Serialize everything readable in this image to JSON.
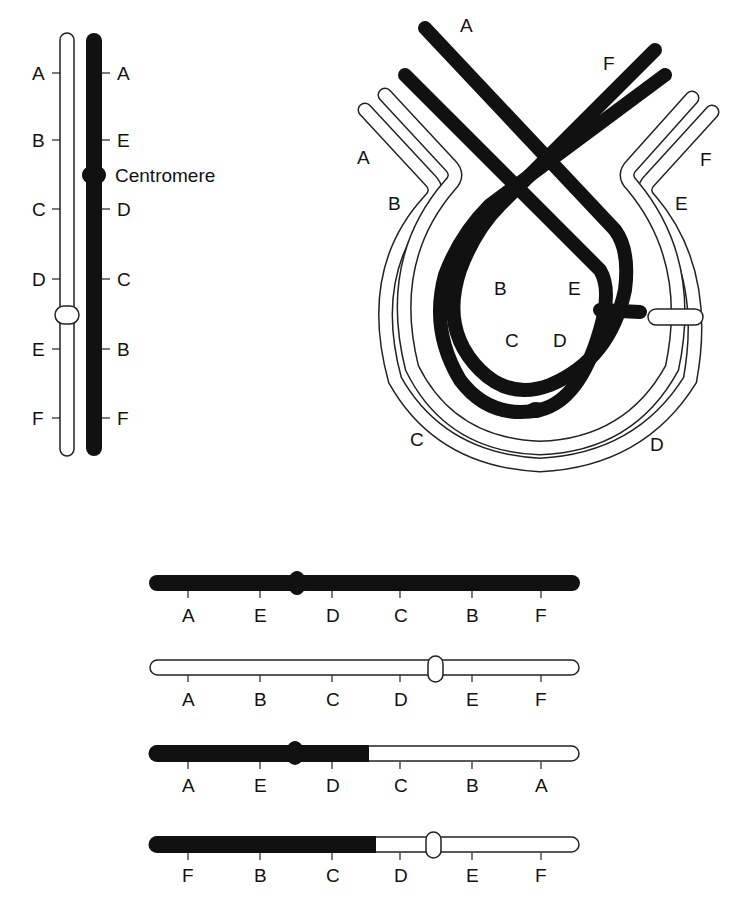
{
  "figure": {
    "type": "paracentric-inversion-diagram",
    "colors": {
      "inverted_chromosome": "#111111",
      "normal_chromosome": "#ffffff",
      "outline": "#222222"
    }
  },
  "panel_top_left": {
    "normal_chromosome": {
      "labels": [
        "A",
        "B",
        "C",
        "D",
        "E",
        "F"
      ],
      "fill": "white"
    },
    "inverted_chromosome": {
      "labels": [
        "A",
        "E",
        "D",
        "C",
        "B",
        "F"
      ],
      "fill": "black"
    },
    "centromere_label": "Centromere"
  },
  "panel_top_right": {
    "description": "Inversion loop formed during synapsis",
    "outer_labels": [
      "A",
      "B",
      "C",
      "D",
      "E",
      "F"
    ],
    "inner_labels": [
      "A",
      "B",
      "C",
      "D",
      "E",
      "F"
    ]
  },
  "panel_bottom": {
    "products": [
      {
        "id": "inverted",
        "labels": [
          "A",
          "E",
          "D",
          "C",
          "B",
          "F"
        ],
        "style": "black"
      },
      {
        "id": "normal",
        "labels": [
          "A",
          "B",
          "C",
          "D",
          "E",
          "F"
        ],
        "style": "white"
      },
      {
        "id": "dicentric-recombinant",
        "labels": [
          "A",
          "E",
          "D",
          "C",
          "B",
          "A"
        ],
        "style": "black-white"
      },
      {
        "id": "acentric-recombinant",
        "labels": [
          "F",
          "B",
          "C",
          "D",
          "E",
          "F"
        ],
        "style": "black-white"
      }
    ]
  }
}
